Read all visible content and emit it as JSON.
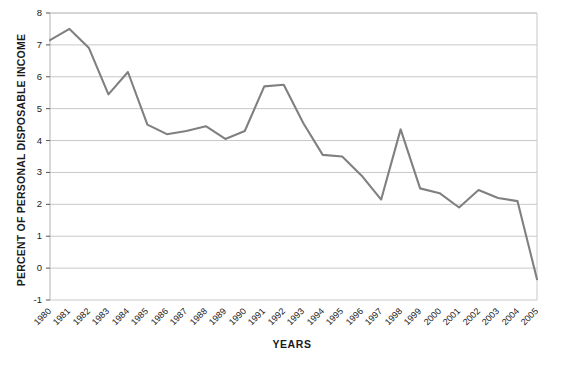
{
  "chart_data": {
    "type": "line",
    "title": "",
    "xlabel": "YEARS",
    "ylabel": "PERCENT OF PERSONAL DISPOSABLE INCOME",
    "categories": [
      "1980",
      "1981",
      "1982",
      "1983",
      "1984",
      "1985",
      "1986",
      "1987",
      "1988",
      "1989",
      "1990",
      "1991",
      "1992",
      "1993",
      "1994",
      "1995",
      "1996",
      "1997",
      "1998",
      "1999",
      "2000",
      "2001",
      "2002",
      "2003",
      "2004",
      "2005"
    ],
    "values": [
      7.15,
      7.5,
      6.9,
      5.45,
      6.15,
      4.5,
      4.2,
      4.3,
      4.45,
      4.05,
      4.3,
      5.7,
      5.75,
      4.55,
      3.55,
      3.5,
      2.9,
      2.15,
      4.35,
      2.5,
      2.35,
      1.9,
      2.45,
      2.2,
      2.1,
      -0.35
    ],
    "ylim": [
      -1,
      8
    ],
    "ytick_labels": [
      "8",
      "7",
      "6",
      "5",
      "4",
      "3",
      "2",
      "1",
      "0",
      "-1"
    ],
    "ytick_values": [
      8,
      7,
      6,
      5,
      4,
      3,
      2,
      1,
      0,
      -1
    ],
    "grid": true,
    "legend": "none",
    "series_color": "#808080",
    "grid_color": "#c8c8c8",
    "axis_color": "#b4b4b4"
  }
}
